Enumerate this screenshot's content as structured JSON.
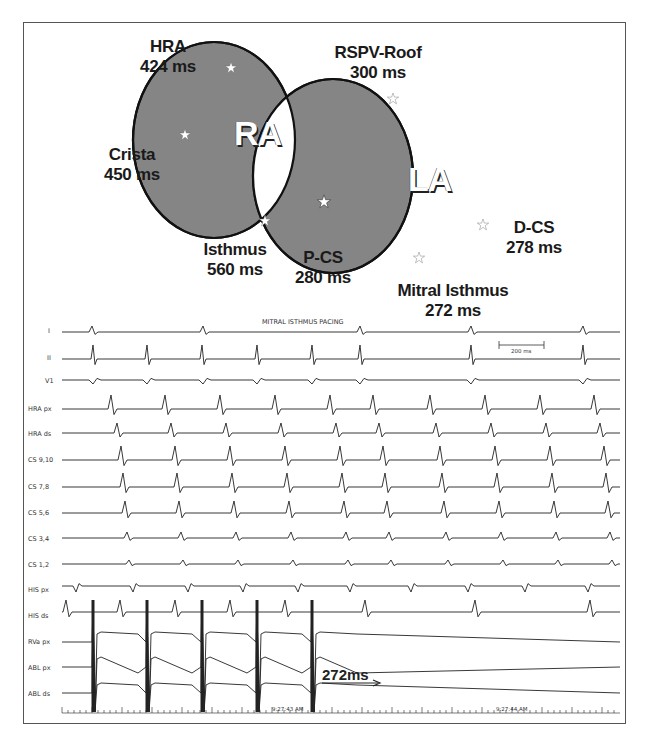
{
  "diagram": {
    "chambers": [
      {
        "id": "ra",
        "label": "RA"
      },
      {
        "id": "la",
        "label": "LA"
      }
    ],
    "sites": [
      {
        "name": "HRA",
        "time": "424 ms",
        "chamber": "RA"
      },
      {
        "name": "Crista",
        "time": "450 ms",
        "chamber": "RA"
      },
      {
        "name": "Isthmus",
        "time": "560 ms",
        "chamber": "RA"
      },
      {
        "name": "RSPV-Roof",
        "time": "300 ms",
        "chamber": "LA"
      },
      {
        "name": "P-CS",
        "time": "280 ms",
        "chamber": "septal overlap"
      },
      {
        "name": "D-CS",
        "time": "278 ms",
        "chamber": "LA"
      },
      {
        "name": "Mitral Isthmus",
        "time": "272 ms",
        "chamber": "LA"
      }
    ],
    "colors": {
      "chamber_fill": "#858585",
      "outline": "#111111",
      "star": "#ffffff"
    }
  },
  "tracing": {
    "title": "MITRAL ISTHMUS PACING",
    "scale_bar": "200 ms",
    "leads": [
      "I",
      "II",
      "V1",
      "HRA px",
      "HRA ds",
      "CS 9,10",
      "CS 7,8",
      "CS 5,6",
      "CS 3,4",
      "CS 1,2",
      "HIS px",
      "HIS ds",
      "RVa px",
      "ABL px",
      "ABL ds"
    ],
    "annotation": "272ms",
    "timestamps": [
      "9:27:43 AM",
      "9:27:44 AM"
    ]
  }
}
